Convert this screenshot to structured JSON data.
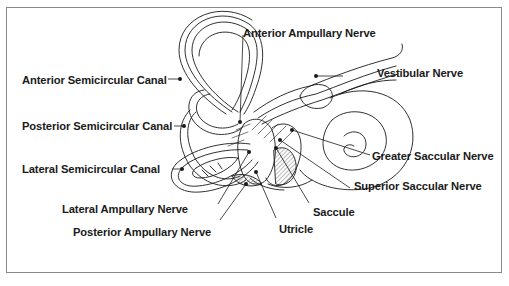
{
  "diagram": {
    "type": "anatomical-illustration",
    "colors": {
      "line": "#1a1a1a",
      "frame": "#8a8a8a",
      "background": "#ffffff",
      "hatch": "#555555"
    },
    "labels": [
      {
        "id": "anterior-ampullary-nerve",
        "text": "Anterior Ampullary Nerve"
      },
      {
        "id": "vestibular-nerve",
        "text": "Vestibular Nerve"
      },
      {
        "id": "anterior-semicircular-canal",
        "text": "Anterior Semicircular Canal"
      },
      {
        "id": "posterior-semicircular-canal",
        "text": "Posterior Semicircular Canal"
      },
      {
        "id": "greater-saccular-nerve",
        "text": "Greater Saccular Nerve"
      },
      {
        "id": "lateral-semicircular-canal",
        "text": "Lateral Semicircular Canal"
      },
      {
        "id": "superior-saccular-nerve",
        "text": "Superior Saccular Nerve"
      },
      {
        "id": "lateral-ampullary-nerve",
        "text": "Lateral Ampullary Nerve"
      },
      {
        "id": "saccule",
        "text": "Saccule"
      },
      {
        "id": "posterior-ampullary-nerve",
        "text": "Posterior Ampullary Nerve"
      },
      {
        "id": "utricle",
        "text": "Utricle"
      }
    ]
  }
}
